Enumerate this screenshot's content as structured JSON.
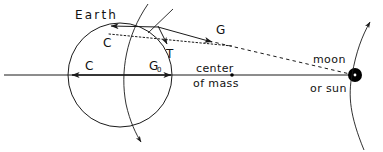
{
  "figure": {
    "labels": {
      "earth": "Earth",
      "center_upper": "center",
      "center_lower": "of mass",
      "moon": "moon",
      "or_sun": "or sun",
      "vector_c_top": "C",
      "vector_c_axis": "C",
      "vector_g_top": "G",
      "vector_g_axis": "G",
      "vector_g_axis_sub": "0",
      "vector_t": "T"
    },
    "colors": {
      "ink": "#1a1a1a",
      "body": "#000000",
      "background": "#ffffff"
    },
    "geometry": {
      "earth_center_x": 120,
      "earth_center_y": 75,
      "earth_radius": 52,
      "axis_y": 75,
      "axis_x_start": 4,
      "axis_x_end": 360,
      "center_of_mass_x": 232,
      "center_of_mass_y": 75,
      "body_x": 355,
      "body_y": 75,
      "body_radius": 7
    }
  }
}
